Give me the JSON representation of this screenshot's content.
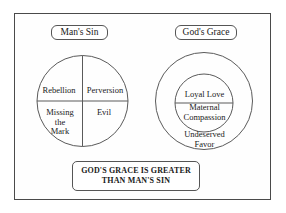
{
  "diagram": {
    "title_text": "GOD'S GRACE IS GREATER THAN MAN'S SIN",
    "left": {
      "caption": "Man's Sin",
      "quadrants": [
        {
          "id": "rebellion",
          "label": "Rebellion"
        },
        {
          "id": "perversion",
          "label": "Perversion"
        },
        {
          "id": "missing",
          "label": "Missing\nthe\nMark"
        },
        {
          "id": "evil",
          "label": "Evil"
        }
      ]
    },
    "right": {
      "caption": "God's Grace",
      "outer_label": "Undeserved\nFavor",
      "inner_top_label": "Loyal Love",
      "inner_bottom_label": "Maternal\nCompassion"
    },
    "statement": {
      "line1": "GOD'S GRACE IS GREATER",
      "line2": "THAN MAN'S SIN"
    },
    "colors": {
      "frame_stroke": "#4a4a4a",
      "circle_stroke": "#5a5a5a",
      "box_stroke": "#555555",
      "text": "#1a1a1a",
      "background": "#ffffff"
    }
  }
}
